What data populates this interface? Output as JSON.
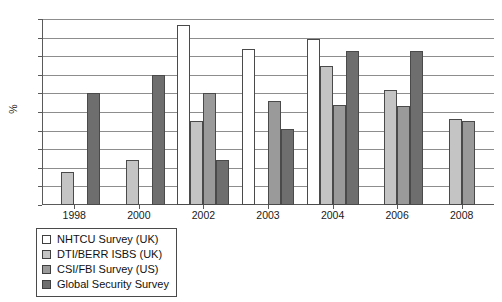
{
  "chart_data": {
    "type": "bar",
    "title": "",
    "xlabel": "",
    "ylabel": "%",
    "ylim": [
      0,
      100
    ],
    "ytick_step": 10,
    "yticks": [
      100,
      90,
      80,
      70,
      60,
      50,
      40,
      30,
      20,
      10,
      0
    ],
    "grid": "horizontal",
    "legend_position": "below-left",
    "categories": [
      "1998",
      "2000",
      "2002",
      "2003",
      "2004",
      "2006",
      "2008"
    ],
    "series": [
      {
        "name": "NHTCU Survey (UK)",
        "color": "#ffffff",
        "values": [
          null,
          null,
          97,
          84,
          89,
          null,
          null
        ]
      },
      {
        "name": "DTI/BERR ISBS (UK)",
        "color": "#c4c4c4",
        "values": [
          18,
          24,
          45,
          null,
          75,
          62,
          46
        ]
      },
      {
        "name": "CSI/FBI Survey (US)",
        "color": "#9a9a9a",
        "values": [
          null,
          null,
          60,
          56,
          54,
          53,
          45
        ]
      },
      {
        "name": "Global Security Survey",
        "color": "#6e6e6e",
        "values": [
          60,
          70,
          24,
          41,
          83,
          83,
          null
        ]
      }
    ]
  },
  "legend": {
    "items": [
      {
        "label": "NHTCU Survey (UK)",
        "swatch": "#ffffff"
      },
      {
        "label": "DTI/BERR ISBS (UK)",
        "swatch": "#c4c4c4"
      },
      {
        "label": "CSI/FBI Survey (US)",
        "swatch": "#9a9a9a"
      },
      {
        "label": "Global Security Survey",
        "swatch": "#6e6e6e"
      }
    ]
  }
}
